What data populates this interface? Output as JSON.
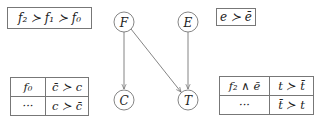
{
  "preferences": {
    "f_order": "f₂ ≻ f₁ ≻ f₀",
    "e_order": "e ≻ ē"
  },
  "nodes": [
    {
      "id": "F",
      "label": "F",
      "cx": 124,
      "cy": 22
    },
    {
      "id": "E",
      "label": "E",
      "cx": 188,
      "cy": 22
    },
    {
      "id": "C",
      "label": "C",
      "cx": 124,
      "cy": 100
    },
    {
      "id": "T",
      "label": "T",
      "cx": 188,
      "cy": 100
    }
  ],
  "edges": [
    {
      "from": "F",
      "to": "C"
    },
    {
      "from": "F",
      "to": "T"
    },
    {
      "from": "E",
      "to": "T"
    }
  ],
  "cpt_c": {
    "rows": [
      {
        "condition": "f₀",
        "preference": "c̄ ≻ c"
      },
      {
        "condition": "···",
        "preference": "c ≻ c̄"
      }
    ]
  },
  "cpt_t": {
    "rows": [
      {
        "condition": "f₂ ∧ ē",
        "preference": "t ≻ t̄"
      },
      {
        "condition": "···",
        "preference": "t̄ ≻ t"
      }
    ]
  }
}
